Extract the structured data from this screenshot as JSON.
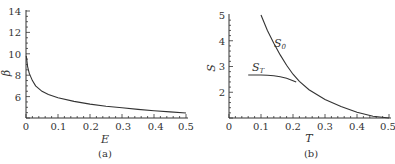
{
  "chart_data": [
    {
      "type": "line",
      "panel": "(a)",
      "xlabel": "E",
      "ylabel": "β",
      "xlim": [
        0,
        0.5
      ],
      "ylim": [
        4,
        14
      ],
      "x_ticks": [
        "0",
        "0.1",
        "0.2",
        "0.3",
        "0.4",
        "0.5"
      ],
      "y_ticks": [
        "6",
        "8",
        "10",
        "12",
        "14"
      ],
      "grid": false,
      "series": [
        {
          "name": "β(E)",
          "x": [
            0.001,
            0.005,
            0.01,
            0.02,
            0.03,
            0.05,
            0.07,
            0.1,
            0.15,
            0.2,
            0.25,
            0.3,
            0.35,
            0.4,
            0.45,
            0.5
          ],
          "y": [
            9.8,
            8.8,
            8.2,
            7.5,
            7.0,
            6.5,
            6.2,
            5.9,
            5.55,
            5.3,
            5.1,
            4.95,
            4.8,
            4.68,
            4.57,
            4.47
          ]
        }
      ]
    },
    {
      "type": "line",
      "panel": "(b)",
      "xlabel": "T",
      "ylabel": "S",
      "xlim": [
        0,
        0.5
      ],
      "ylim": [
        1,
        5
      ],
      "x_ticks": [
        "0",
        "0.1",
        "0.2",
        "0.3",
        "0.4",
        "0.5"
      ],
      "y_ticks": [
        "2",
        "3",
        "4",
        "5"
      ],
      "grid": false,
      "series": [
        {
          "name": "S_0",
          "x": [
            0.1,
            0.12,
            0.14,
            0.16,
            0.18,
            0.2,
            0.22,
            0.25,
            0.3,
            0.35,
            0.4,
            0.45,
            0.5
          ],
          "y": [
            5.0,
            4.4,
            3.9,
            3.45,
            3.05,
            2.7,
            2.42,
            2.1,
            1.72,
            1.45,
            1.22,
            1.07,
            1.0
          ]
        },
        {
          "name": "S_T",
          "x": [
            0.06,
            0.08,
            0.1,
            0.12,
            0.14,
            0.16,
            0.18,
            0.2,
            0.21
          ],
          "y": [
            2.67,
            2.67,
            2.67,
            2.66,
            2.64,
            2.6,
            2.54,
            2.45,
            2.4
          ]
        }
      ],
      "annotations": [
        {
          "text": "S_0",
          "x": 0.19,
          "y": 3.9
        },
        {
          "text": "S_T",
          "x": 0.09,
          "y": 2.95
        }
      ]
    }
  ],
  "panels": {
    "a": {
      "caption": "(a)",
      "xlabel": "E",
      "ylabel": "β",
      "xticks": [
        "0",
        "0.1",
        "0.2",
        "0.3",
        "0.4",
        "0.5"
      ],
      "yticks": [
        "6",
        "8",
        "10",
        "12",
        "14"
      ]
    },
    "b": {
      "caption": "(b)",
      "xlabel": "T",
      "ylabel": "S",
      "xticks": [
        "0",
        "0.1",
        "0.2",
        "0.3",
        "0.4",
        "0.5"
      ],
      "yticks": [
        "2",
        "3",
        "4",
        "5"
      ],
      "label_s0": "S",
      "label_s0_sub": "0",
      "label_st": "S",
      "label_st_sub": "T"
    }
  }
}
